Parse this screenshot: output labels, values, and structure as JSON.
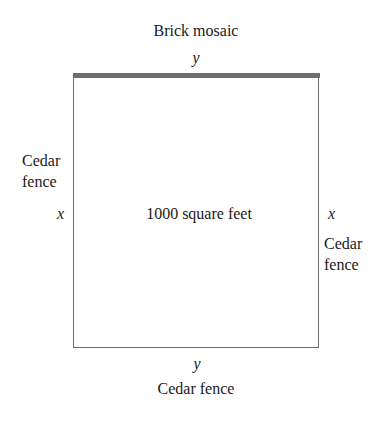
{
  "diagram": {
    "region_label": "1000 square feet",
    "top": {
      "material": "Brick mosaic",
      "variable": "y"
    },
    "bottom": {
      "material": "Cedar fence",
      "variable": "y"
    },
    "left": {
      "material_line1": "Cedar",
      "material_line2": "fence",
      "variable": "x"
    },
    "right": {
      "material_line1": "Cedar",
      "material_line2": "fence",
      "variable": "x"
    },
    "colors": {
      "border": "#6b6b6b",
      "brick_edge": "#6e6e6e",
      "text": "#1a1a1a"
    }
  }
}
